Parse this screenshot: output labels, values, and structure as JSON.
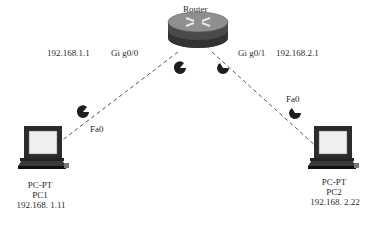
{
  "diagram": {
    "type": "network-topology",
    "router": {
      "label": "Router",
      "interfaces": [
        {
          "name": "Gi g0/0",
          "ip": "192.168.1.1",
          "ip_label": "192.168.1.1",
          "if_label": "Gi g0/0"
        },
        {
          "name": "Gi g0/1",
          "ip": "192.168.2.1",
          "ip_label": "192.168.2.1",
          "if_label": "Gi g0/1"
        }
      ]
    },
    "pcs": [
      {
        "type_label": "PC-PT",
        "name": "PC1",
        "ip": "192.168. 1.11",
        "port": "Fa0"
      },
      {
        "type_label": "PC-PT",
        "name": "PC2",
        "ip": "192.168. 2.22",
        "port": "Fa0"
      }
    ],
    "links": [
      {
        "from": "Router Gi g0/0",
        "to": "PC1 Fa0",
        "style": "dashed"
      },
      {
        "from": "Router Gi g0/1",
        "to": "PC2 Fa0",
        "style": "dashed"
      }
    ],
    "colors": {
      "link": "#555555",
      "device_dark": "#2b2b2b",
      "screen": "#f0f0f0",
      "text": "#2a2a2a",
      "background": "#ffffff"
    }
  }
}
